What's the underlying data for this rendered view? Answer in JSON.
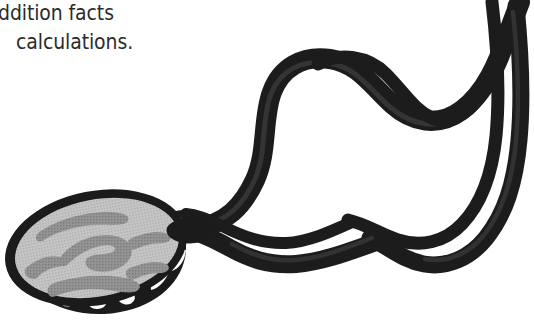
{
  "page": {
    "width": 534,
    "height": 329,
    "background_color": "#ffffff",
    "kind": "scanned-clip-art-fragment"
  },
  "text_block": {
    "lines": [
      {
        "id": "line-1",
        "text": "ddition facts",
        "cropped_at_left": true,
        "full_text_guess": "addition facts"
      },
      {
        "id": "line-2",
        "text": "calculations."
      }
    ],
    "text_color": "#2b2b2b"
  },
  "illustration": {
    "title": "Pendant whistle on a looping neck cord",
    "description": "A round medallion / whistle with a halftone grey face and dark outline, teeth-like white slots along its lower rim, attached to a thick black cord that loops up and to the right across the frame.",
    "colors": {
      "outline": "#1b1b1b",
      "cord": "#1f1f1f",
      "cord_shadow": "#3a3a3a",
      "face_fill": "#bdbdbd",
      "face_marking": "#8e8e8e",
      "rim_fill": "#1b1b1b",
      "slot_fill": "#ffffff",
      "background": "#ffffff"
    },
    "parts": [
      {
        "name": "medallion-face",
        "label": "Whistle body"
      },
      {
        "name": "medallion-rim",
        "label": "Slotted rim"
      },
      {
        "name": "cord-loop",
        "label": "Neck cord loop"
      },
      {
        "name": "cord-strands",
        "label": "Cord strands"
      }
    ]
  }
}
